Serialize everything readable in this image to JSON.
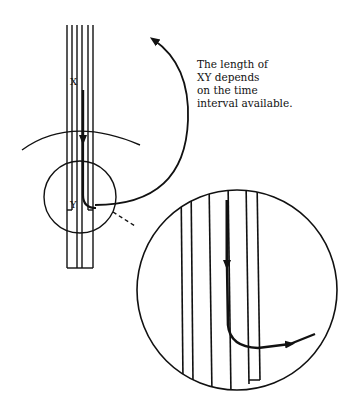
{
  "diagram": {
    "labels": {
      "start": "X",
      "end": "Y"
    },
    "caption": {
      "lines": [
        "The length of",
        "XY depends",
        "on the time",
        "interval available."
      ]
    },
    "colors": {
      "ink": "#111111",
      "background": "#ffffff"
    }
  }
}
